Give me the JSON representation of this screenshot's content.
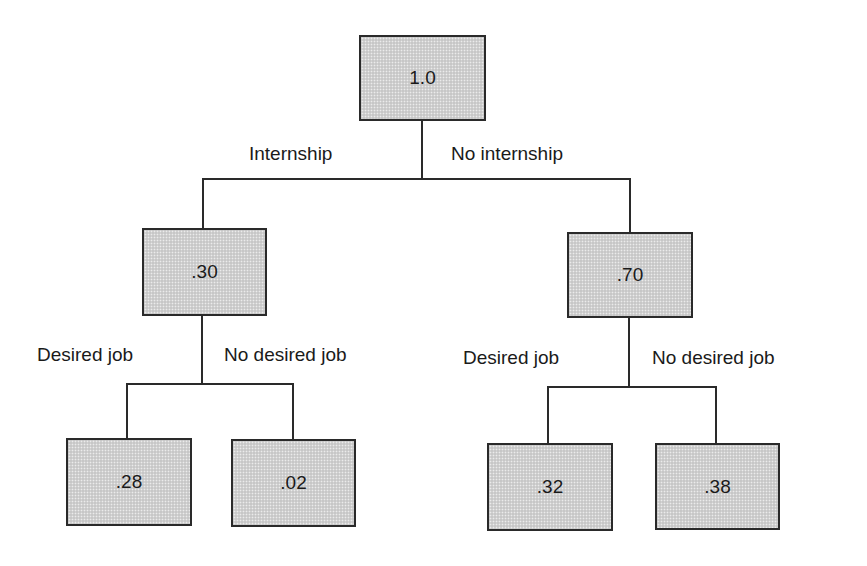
{
  "diagram": {
    "type": "probability-tree",
    "root": {
      "label": "1.0"
    },
    "level1": {
      "branches": [
        {
          "edge_label": "Internship",
          "node_label": ".30"
        },
        {
          "edge_label": "No internship",
          "node_label": ".70"
        }
      ]
    },
    "level2": {
      "internship": {
        "branches": [
          {
            "edge_label": "Desired job",
            "node_label": ".28"
          },
          {
            "edge_label": "No desired job",
            "node_label": ".02"
          }
        ]
      },
      "no_internship": {
        "branches": [
          {
            "edge_label": "Desired job",
            "node_label": ".32"
          },
          {
            "edge_label": "No desired job",
            "node_label": ".38"
          }
        ]
      }
    },
    "colors": {
      "box_fill": "#d2d2d2",
      "box_border": "#2a2a2a",
      "line": "#2a2a2a",
      "text": "#1a1a1a",
      "background": "#ffffff"
    }
  }
}
